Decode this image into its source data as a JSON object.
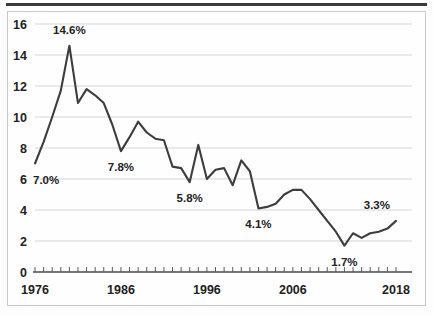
{
  "chart_data": {
    "type": "line",
    "title": "",
    "subtitle": "",
    "xlabel": "",
    "ylabel": "",
    "xlim": [
      1976,
      2018
    ],
    "ylim": [
      0,
      16
    ],
    "grid": true,
    "legend": "none",
    "y_ticks": [
      0,
      2,
      4,
      6,
      8,
      10,
      12,
      14,
      16
    ],
    "y_tick_labels": [
      "0",
      "2",
      "4",
      "6",
      "8",
      "10",
      "12",
      "14",
      "16"
    ],
    "x_tick_labels": [
      "1976",
      "1986",
      "1996",
      "2006",
      "2018"
    ],
    "x_tick_label_values": [
      1976,
      1986,
      1996,
      2006,
      2018
    ],
    "x_minor_tick_step": 1,
    "series": [
      {
        "name": "rate",
        "x": [
          1976,
          1977,
          1978,
          1979,
          1980,
          1981,
          1982,
          1983,
          1984,
          1985,
          1986,
          1987,
          1988,
          1989,
          1990,
          1991,
          1992,
          1993,
          1994,
          1995,
          1996,
          1997,
          1998,
          1999,
          2000,
          2001,
          2002,
          2003,
          2004,
          2005,
          2006,
          2007,
          2008,
          2009,
          2010,
          2011,
          2012,
          2013,
          2014,
          2015,
          2016,
          2017,
          2018
        ],
        "values": [
          7.0,
          8.4,
          10.0,
          11.7,
          14.6,
          10.9,
          11.8,
          11.4,
          10.9,
          9.5,
          7.8,
          8.7,
          9.7,
          9.0,
          8.6,
          8.5,
          6.8,
          6.7,
          5.8,
          8.2,
          6.0,
          6.6,
          6.7,
          5.6,
          7.2,
          6.5,
          4.1,
          4.2,
          4.4,
          5.0,
          5.3,
          5.3,
          4.7,
          4.0,
          3.3,
          2.6,
          1.7,
          2.5,
          2.2,
          2.5,
          2.6,
          2.8,
          3.3
        ]
      }
    ],
    "annotations": [
      {
        "label": "7.0%",
        "value": 7.0,
        "year": 1976,
        "position": "below-right"
      },
      {
        "label": "14.6%",
        "value": 14.6,
        "year": 1980,
        "position": "above"
      },
      {
        "label": "7.8%",
        "value": 7.8,
        "year": 1986,
        "position": "below"
      },
      {
        "label": "5.8%",
        "value": 5.8,
        "year": 1994,
        "position": "below"
      },
      {
        "label": "4.1%",
        "value": 4.1,
        "year": 2002,
        "position": "below"
      },
      {
        "label": "1.7%",
        "value": 1.7,
        "year": 2012,
        "position": "below"
      },
      {
        "label": "3.3%",
        "value": 3.3,
        "year": 2018,
        "position": "above-left"
      }
    ],
    "colors": {
      "series_line": "#3d3d3d",
      "gridline": "#d5d5d5",
      "axis": "#4a4a4a",
      "text": "#222222",
      "background": "#fefefe",
      "top_rule": "#3a3a3a",
      "frame": "#c9c9c9"
    }
  }
}
